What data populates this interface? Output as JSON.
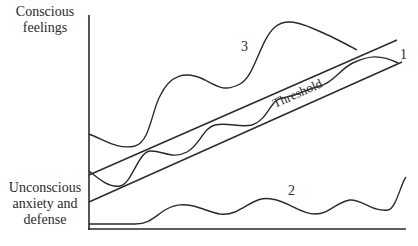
{
  "diagram": {
    "y_axis_top_label": "Conscious feelings",
    "y_axis_bottom_label": "Unconscious anxiety and defense",
    "threshold_label": "Threshold",
    "curve_labels": {
      "curve1": "1",
      "curve2": "2",
      "curve3": "3"
    },
    "colors": {
      "line": "#2a2a2a",
      "background": "#ffffff"
    }
  }
}
